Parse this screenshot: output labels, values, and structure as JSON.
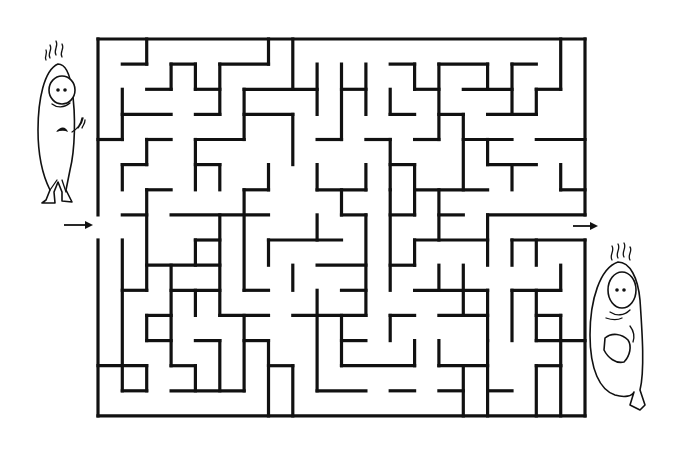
{
  "puzzle": {
    "type": "rectangular-maze",
    "cols": 20,
    "rows": 15,
    "origin_px": [
      98,
      39
    ],
    "cell_px": [
      24.35,
      25.13
    ],
    "wall_color": "#111111",
    "background": "#ffffff",
    "entrance": {
      "side": "left",
      "row": 7,
      "label": "Start"
    },
    "exit": {
      "side": "right",
      "row": 7,
      "label": "Finish"
    },
    "start_arrow": {
      "x1": 64,
      "y1": 225,
      "x2": 92,
      "y2": 225
    },
    "end_arrow": {
      "x1": 573,
      "y1": 226,
      "x2": 598,
      "y2": 226
    },
    "characters": [
      {
        "name": "worried-character",
        "position": "left",
        "description": "Nervous sweating cartoon figure standing at the entrance"
      },
      {
        "name": "cowering-character",
        "position": "right",
        "description": "Frightened cartoon figure crouching at the exit"
      }
    ],
    "h_walls": [
      [
        0,
        0,
        20
      ],
      [
        1,
        1,
        2
      ],
      [
        1,
        3,
        4
      ],
      [
        1,
        5,
        7
      ],
      [
        1,
        12,
        13
      ],
      [
        1,
        14,
        16
      ],
      [
        1,
        17,
        18
      ],
      [
        2,
        2,
        3
      ],
      [
        2,
        4,
        5
      ],
      [
        2,
        6,
        9
      ],
      [
        2,
        10,
        11
      ],
      [
        2,
        13,
        14
      ],
      [
        2,
        15,
        17
      ],
      [
        2,
        18,
        19
      ],
      [
        3,
        1,
        3
      ],
      [
        3,
        4,
        5
      ],
      [
        3,
        6,
        8
      ],
      [
        3,
        12,
        13
      ],
      [
        3,
        14,
        15
      ],
      [
        3,
        16,
        18
      ],
      [
        4,
        0,
        1
      ],
      [
        4,
        2,
        3
      ],
      [
        4,
        4,
        6
      ],
      [
        4,
        9,
        10
      ],
      [
        4,
        11,
        12
      ],
      [
        4,
        13,
        14
      ],
      [
        4,
        15,
        17
      ],
      [
        4,
        18,
        20
      ],
      [
        5,
        1,
        2
      ],
      [
        5,
        4,
        5
      ],
      [
        5,
        12,
        13
      ],
      [
        5,
        16,
        18
      ],
      [
        6,
        2,
        3
      ],
      [
        6,
        6,
        7
      ],
      [
        6,
        9,
        11
      ],
      [
        6,
        13,
        16
      ],
      [
        6,
        19,
        20
      ],
      [
        7,
        1,
        2
      ],
      [
        7,
        3,
        7
      ],
      [
        7,
        10,
        11
      ],
      [
        7,
        12,
        13
      ],
      [
        7,
        14,
        15
      ],
      [
        7,
        16,
        20
      ],
      [
        8,
        4,
        5
      ],
      [
        8,
        7,
        10
      ],
      [
        8,
        13,
        16
      ],
      [
        8,
        17,
        20
      ],
      [
        9,
        2,
        5
      ],
      [
        9,
        9,
        11
      ],
      [
        9,
        12,
        13
      ],
      [
        10,
        1,
        2
      ],
      [
        10,
        3,
        5
      ],
      [
        10,
        6,
        7
      ],
      [
        10,
        10,
        11
      ],
      [
        10,
        13,
        16
      ],
      [
        10,
        17,
        19
      ],
      [
        11,
        2,
        3
      ],
      [
        11,
        5,
        7
      ],
      [
        11,
        8,
        11
      ],
      [
        11,
        12,
        13
      ],
      [
        11,
        14,
        16
      ],
      [
        11,
        18,
        19
      ],
      [
        12,
        2,
        3
      ],
      [
        12,
        4,
        5
      ],
      [
        12,
        6,
        7
      ],
      [
        12,
        10,
        11
      ],
      [
        12,
        18,
        20
      ],
      [
        13,
        0,
        2
      ],
      [
        13,
        3,
        4
      ],
      [
        13,
        7,
        8
      ],
      [
        13,
        10,
        13
      ],
      [
        13,
        14,
        16
      ],
      [
        13,
        18,
        19
      ],
      [
        14,
        1,
        2
      ],
      [
        14,
        3,
        6
      ],
      [
        14,
        9,
        11
      ],
      [
        14,
        12,
        13
      ],
      [
        14,
        14,
        15
      ],
      [
        14,
        16,
        17
      ],
      [
        15,
        0,
        20
      ]
    ],
    "v_walls": [
      [
        0,
        0,
        7
      ],
      [
        0,
        8,
        15
      ],
      [
        20,
        0,
        7
      ],
      [
        20,
        8,
        15
      ],
      [
        1,
        2,
        4
      ],
      [
        1,
        5,
        6
      ],
      [
        1,
        8,
        14
      ],
      [
        2,
        0,
        1
      ],
      [
        2,
        4,
        5
      ],
      [
        2,
        6,
        10
      ],
      [
        2,
        11,
        12
      ],
      [
        2,
        13,
        14
      ],
      [
        3,
        1,
        2
      ],
      [
        3,
        9,
        13
      ],
      [
        4,
        1,
        2
      ],
      [
        4,
        4,
        6
      ],
      [
        4,
        8,
        9
      ],
      [
        4,
        10,
        11
      ],
      [
        4,
        13,
        14
      ],
      [
        5,
        1,
        3
      ],
      [
        5,
        5,
        6
      ],
      [
        5,
        7,
        11
      ],
      [
        5,
        12,
        14
      ],
      [
        6,
        2,
        4
      ],
      [
        6,
        6,
        10
      ],
      [
        6,
        11,
        14
      ],
      [
        7,
        0,
        1
      ],
      [
        7,
        5,
        6
      ],
      [
        7,
        8,
        9
      ],
      [
        7,
        12,
        15
      ],
      [
        8,
        0,
        2
      ],
      [
        8,
        3,
        5
      ],
      [
        8,
        9,
        10
      ],
      [
        8,
        13,
        15
      ],
      [
        9,
        1,
        3
      ],
      [
        9,
        5,
        6
      ],
      [
        9,
        7,
        8
      ],
      [
        9,
        10,
        14
      ],
      [
        10,
        1,
        4
      ],
      [
        10,
        6,
        7
      ],
      [
        10,
        11,
        13
      ],
      [
        11,
        1,
        3
      ],
      [
        11,
        5,
        6
      ],
      [
        11,
        7,
        11
      ],
      [
        12,
        2,
        3
      ],
      [
        12,
        4,
        6
      ],
      [
        12,
        6,
        10
      ],
      [
        12,
        11,
        12
      ],
      [
        13,
        1,
        2
      ],
      [
        13,
        5,
        7
      ],
      [
        13,
        8,
        9
      ],
      [
        13,
        12,
        13
      ],
      [
        14,
        1,
        4
      ],
      [
        14,
        6,
        8
      ],
      [
        14,
        9,
        10
      ],
      [
        14,
        12,
        13
      ],
      [
        15,
        3,
        6
      ],
      [
        15,
        9,
        11
      ],
      [
        15,
        13,
        15
      ],
      [
        16,
        1,
        2
      ],
      [
        16,
        4,
        5
      ],
      [
        16,
        7,
        9
      ],
      [
        16,
        10,
        12
      ],
      [
        16,
        12,
        15
      ],
      [
        17,
        1,
        3
      ],
      [
        17,
        5,
        6
      ],
      [
        17,
        8,
        9
      ],
      [
        17,
        10,
        12
      ],
      [
        18,
        2,
        3
      ],
      [
        18,
        8,
        9
      ],
      [
        18,
        10,
        12
      ],
      [
        18,
        13,
        15
      ],
      [
        19,
        0,
        2
      ],
      [
        19,
        5,
        6
      ],
      [
        19,
        9,
        10
      ],
      [
        19,
        11,
        13
      ],
      [
        19,
        13,
        15
      ]
    ]
  }
}
